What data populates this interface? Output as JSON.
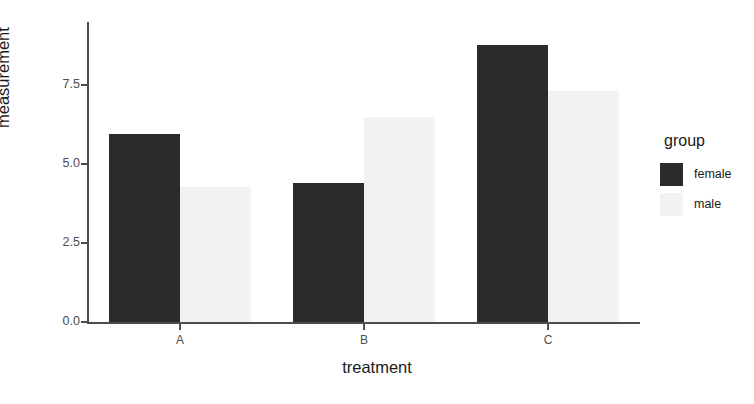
{
  "chart_data": {
    "type": "bar",
    "title": "",
    "subtitle": "",
    "xlabel": "treatment",
    "ylabel": "measurement",
    "categories": [
      "A",
      "B",
      "C"
    ],
    "series": [
      {
        "name": "female",
        "values": [
          5.95,
          4.4,
          8.77
        ],
        "color": "#2b2b2b"
      },
      {
        "name": "male",
        "values": [
          4.27,
          6.48,
          7.31
        ],
        "color": "#f2f2f2"
      }
    ],
    "ylim": [
      0.0,
      9.5
    ],
    "y_ticks": [
      0.0,
      2.5,
      5.0,
      7.5
    ],
    "y_tick_labels": [
      "0.0",
      "2.5",
      "5.0",
      "7.5"
    ],
    "x_tick_labels": [
      "A",
      "B",
      "C"
    ],
    "grid": false,
    "bar_mode": "grouped",
    "legend": {
      "title": "group",
      "position": "right",
      "entries": [
        {
          "label": "female",
          "color": "#2b2b2b"
        },
        {
          "label": "male",
          "color": "#f2f2f2"
        }
      ]
    },
    "axis_color": "#4d4d4d",
    "background": "#ffffff"
  }
}
